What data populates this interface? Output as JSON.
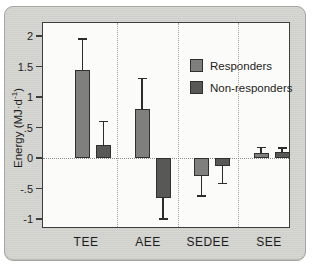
{
  "figure": {
    "type": "grouped bar chart with error bars",
    "background_panel_color": "#d3d3d0",
    "plot_background_color": "#fbfbf9"
  },
  "chart_data": {
    "type": "bar",
    "title": "",
    "xlabel": "",
    "ylabel": "Energy (MJ·d⁻¹)",
    "ylabel_main": "Energy (MJ·d",
    "ylabel_sup": "-1",
    "ylabel_end": ")",
    "categories": [
      "TEE",
      "AEE",
      "SEDEE",
      "SEE"
    ],
    "series": [
      {
        "name": "Responders",
        "color": "#7f7f7d",
        "values": [
          1.45,
          0.8,
          -0.3,
          0.08
        ],
        "errors": [
          0.5,
          0.5,
          0.32,
          0.09
        ]
      },
      {
        "name": "Non-responders",
        "color": "#585856",
        "values": [
          0.22,
          -0.65,
          -0.13,
          0.1
        ],
        "errors": [
          0.38,
          0.35,
          0.29,
          0.06
        ]
      }
    ],
    "error_bar_direction": "away from zero, with caps",
    "y_ticks": [
      "2",
      "1.5",
      "1",
      ".5",
      "0",
      "-.5",
      "-1"
    ],
    "y_tick_values": [
      2,
      1.5,
      1,
      0.5,
      0,
      -0.5,
      -1
    ],
    "ylim": [
      -1.15,
      2.2
    ],
    "grid": "dotted vertical category separators and dotted zero line",
    "legend_position": "top-right inside plot",
    "legend_entries": [
      "Responders",
      "Non-responders"
    ]
  }
}
